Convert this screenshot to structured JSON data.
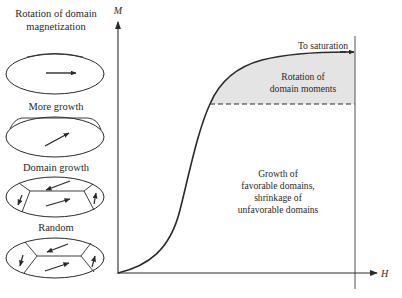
{
  "figure": {
    "axes": {
      "y_label": "M",
      "x_label": "H"
    },
    "annotations": {
      "to_saturation": "To saturation",
      "rotation_region": [
        "Rotation of",
        "domain moments"
      ],
      "growth_region": [
        "Growth of",
        "favorable domains,",
        "shrinkage of",
        "unfavorable domains"
      ]
    },
    "stages": [
      {
        "id": "rotation",
        "caption": [
          "Rotation of domain",
          "magnetization"
        ]
      },
      {
        "id": "more-growth",
        "caption": [
          "More growth"
        ]
      },
      {
        "id": "domain-growth",
        "caption": [
          "Domain growth"
        ]
      },
      {
        "id": "random",
        "caption": [
          "Random"
        ]
      }
    ],
    "colors": {
      "line": "#2a2a2a",
      "shade": "#e4e4e4",
      "saturation_line": "#555555"
    }
  }
}
